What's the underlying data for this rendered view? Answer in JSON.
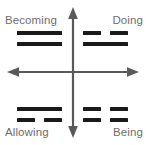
{
  "diagram": {
    "colors": {
      "background": "#ffffff",
      "axis": "#595959",
      "line": "#1a1a1a",
      "label": "#6e6e6e"
    },
    "axes": {
      "vertical_arrow_top": "arrow-up",
      "vertical_arrow_bottom": "arrow-down",
      "horizontal_arrow_left": "arrow-left",
      "horizontal_arrow_right": "arrow-right",
      "origin_x": 73,
      "origin_y": 72
    },
    "quadrants": [
      {
        "position": "top-left",
        "label": "Becoming",
        "lines": [
          "solid",
          "solid"
        ]
      },
      {
        "position": "top-right",
        "label": "Doing",
        "lines": [
          "broken",
          "solid"
        ]
      },
      {
        "position": "bottom-left",
        "label": "Allowing",
        "lines": [
          "solid",
          "broken"
        ]
      },
      {
        "position": "bottom-right",
        "label": "Being",
        "lines": [
          "broken",
          "broken"
        ]
      }
    ]
  }
}
